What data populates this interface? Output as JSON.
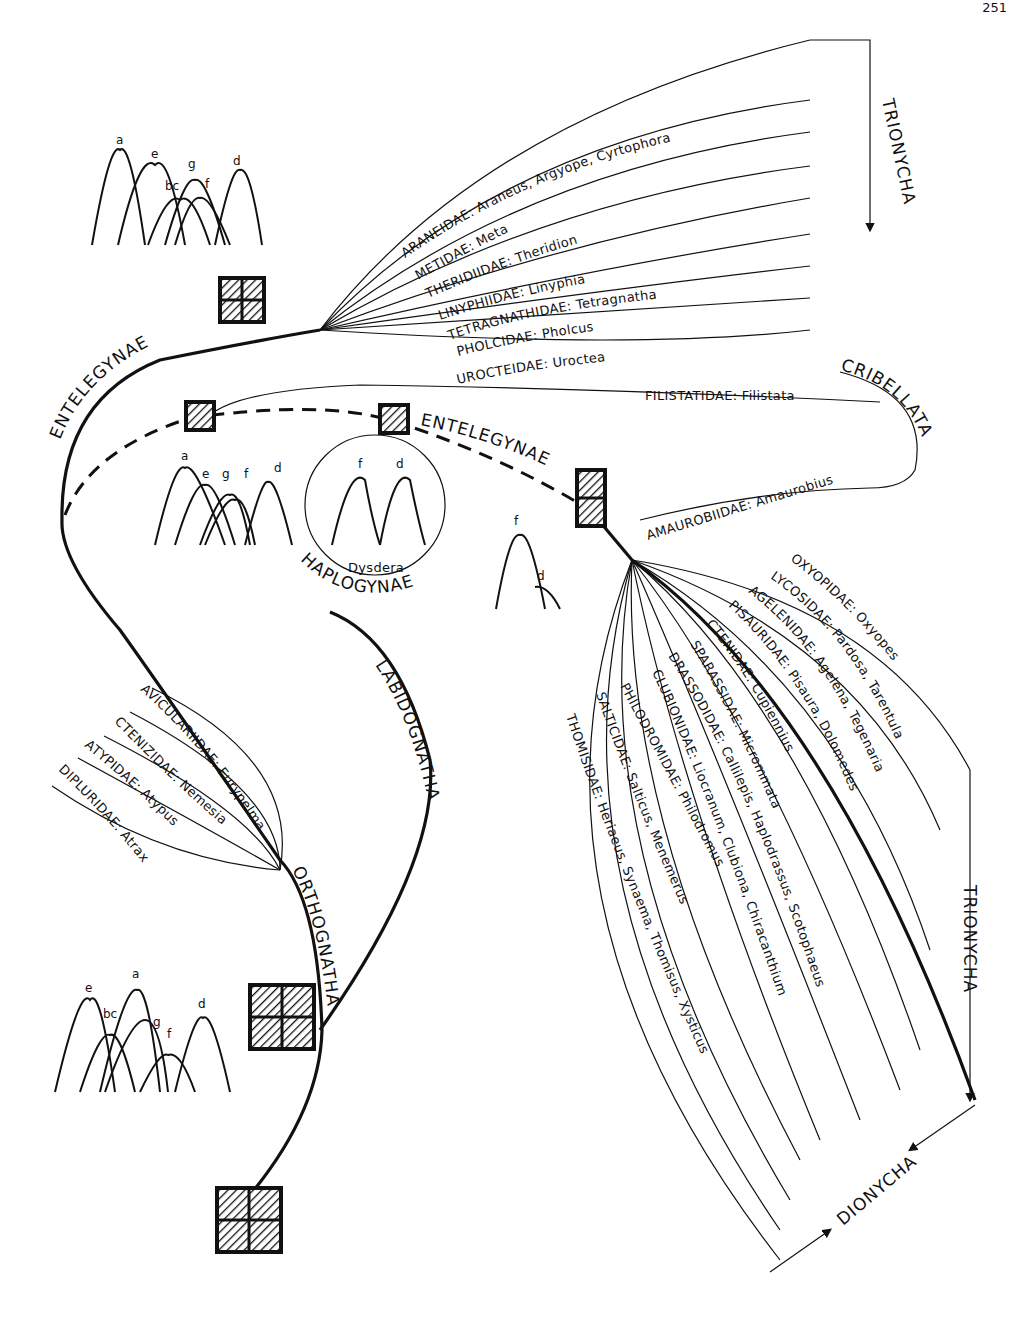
{
  "page_number": "251",
  "clades": {
    "entelegynae_upper": "ENTELEGYNAE",
    "entelegynae_mid": "ENTELEGYNAE",
    "haplogynae": "HAPLOGYNAE",
    "cribellata": "CRIBELLATA",
    "labidognatha": "LABIDOGNATHA",
    "orthognatha": "ORTHOGNATHA",
    "trionycha_top": "TRIONYCHA",
    "trionycha_right": "TRIONYCHA",
    "dionycha": "DIONYCHA"
  },
  "upper_families": [
    "ARANEIDAE: Araneus, Argyope, Cyrtophora",
    "METIDAE: Meta",
    "THERIDIIDAE: Theridion",
    "LINYPHIIDAE: Linyphia",
    "TETRAGNATHIDAE: Tetragnatha",
    "PHOLCIDAE: Pholcus",
    "UROCTEIDAE: Uroctea"
  ],
  "cribellate_families": [
    "FILISTATIDAE: Filistata",
    "AMAUROBIIDAE: Amaurobius"
  ],
  "lower_families": [
    "OXYOPIDAE: Oxyopes",
    "LYCOSIDAE: Pardosa, Tarentula",
    "AGELENIDAE: Agelena, Tegenaria",
    "PISAURIDAE: Pisaura, Dolomedes",
    "CTENIDAE: Cupiennius",
    "SPARASSIDAE: Micrommata",
    "DRASSODIDAE: Callilepis, Haplodrassus, Scotophaeus",
    "CLUBIONIDAE: Liocranum, Clubiona, Chiracanthium",
    "PHILODROMIDAE: Philodromus",
    "SALTICIDAE: Salticus, Menemerus",
    "THOMISIDAE: Heriaeus, Synaema, Thomisus, Xysticus"
  ],
  "orthognath_families": [
    "AVICULARIIDAE: Eurypelma",
    "CTENIZIDAE: Nemesia",
    "ATYPIDAE: Atypus",
    "DIPLURIDAE: Atrax"
  ],
  "peak_charts": {
    "top": [
      "a",
      "e",
      "bc",
      "g",
      "f",
      "d"
    ],
    "middle": [
      "a",
      "e",
      "g",
      "f",
      "d"
    ],
    "dysdera": {
      "peaks": [
        "f",
        "d"
      ],
      "caption": "Dysdera"
    },
    "amaurobius": [
      "f",
      "d"
    ],
    "bottom": [
      "e",
      "bc",
      "a",
      "g",
      "f",
      "d"
    ]
  }
}
